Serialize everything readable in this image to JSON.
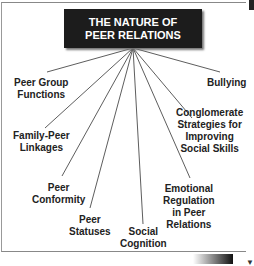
{
  "title": {
    "line1": "THE NATURE OF",
    "line2": "PEER RELATIONS"
  },
  "nodes": [
    {
      "id": "peer-group-functions",
      "line1": "Peer Group",
      "line2": "Functions"
    },
    {
      "id": "family-peer-linkages",
      "line1": "Family-Peer",
      "line2": "Linkages"
    },
    {
      "id": "peer-conformity",
      "line1": "Peer",
      "line2": "Conformity"
    },
    {
      "id": "peer-statuses",
      "line1": "Peer",
      "line2": "Statuses"
    },
    {
      "id": "social-cognition",
      "line1": "Social",
      "line2": "Cognition"
    },
    {
      "id": "emotional-regulation",
      "line1": "Emotional",
      "line2": "Regulation",
      "line3": "in Peer",
      "line4": "Relations"
    },
    {
      "id": "conglomerate-strategies",
      "line1": "Conglomerate",
      "line2": "Strategies for",
      "line3": "Improving",
      "line4": "Social Skills"
    },
    {
      "id": "bullying",
      "line1": "Bullying"
    }
  ],
  "colors": {
    "title_bg": "#1c1c1c",
    "title_text": "#ffffff",
    "line": "#333333",
    "text": "#222222"
  }
}
